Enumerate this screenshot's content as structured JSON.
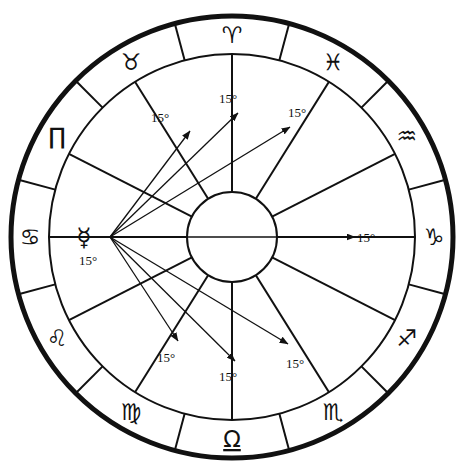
{
  "chart": {
    "type": "astrology-wheel",
    "background_color": "#ffffff",
    "line_color": "#111111",
    "geometry": {
      "center_x": 232,
      "center_y": 237,
      "outer_radius": 221,
      "sign_ring_inner_radius": 183,
      "house_ring_inner_radius": 45,
      "outer_stroke_width": 5,
      "ring_stroke_width": 2,
      "spoke_stroke_width": 2,
      "arrow_stroke_width": 1.3
    },
    "zodiac_ring": {
      "note": "Twelve 30-degree sign sectors, Aries at top, running counter-clockwise",
      "signs": [
        {
          "name": "Aries",
          "glyph": "♈",
          "center_angle_deg": 90,
          "glyph_size": 23,
          "underline": false
        },
        {
          "name": "Taurus",
          "glyph": "♉",
          "center_angle_deg": 120,
          "glyph_size": 23,
          "underline": false
        },
        {
          "name": "Gemini",
          "glyph": "∏",
          "center_angle_deg": 150,
          "glyph_size": 24,
          "underline": false
        },
        {
          "name": "Cancer",
          "glyph": "♋",
          "center_angle_deg": 180,
          "glyph_size": 23,
          "underline": false
        },
        {
          "name": "Leo",
          "glyph": "♌",
          "center_angle_deg": 210,
          "glyph_size": 23,
          "underline": false
        },
        {
          "name": "Virgo",
          "glyph": "♍",
          "center_angle_deg": 240,
          "glyph_size": 23,
          "underline": false
        },
        {
          "name": "Libra",
          "glyph": "Ω",
          "center_angle_deg": 270,
          "glyph_size": 23,
          "underline": true
        },
        {
          "name": "Scorpio",
          "glyph": "♏",
          "center_angle_deg": 300,
          "glyph_size": 23,
          "underline": false
        },
        {
          "name": "Sagittarius",
          "glyph": "♐",
          "center_angle_deg": 330,
          "glyph_size": 23,
          "underline": false
        },
        {
          "name": "Capricorn",
          "glyph": "♑",
          "center_angle_deg": 0,
          "glyph_size": 23,
          "underline": false
        },
        {
          "name": "Aquarius",
          "glyph": "♒",
          "center_angle_deg": 30,
          "glyph_size": 23,
          "underline": false
        },
        {
          "name": "Pisces",
          "glyph": "♓",
          "center_angle_deg": 60,
          "glyph_size": 23,
          "underline": false
        }
      ]
    },
    "house_cusps_deg": [
      0,
      27,
      58,
      90,
      122,
      153,
      180,
      207,
      238,
      270,
      302,
      333
    ],
    "planet": {
      "name": "Mercury",
      "glyph": "☿",
      "degree_label": "15°",
      "sign": "Cancer",
      "position_angle_deg": 180,
      "radius_from_center": 122,
      "glyph_x": 84,
      "glyph_y": 246,
      "degree_x": 88,
      "degree_y": 265
    },
    "aspect_arrows": {
      "origin_x": 110,
      "origin_y": 237,
      "label_text": "15°",
      "arrows": [
        {
          "target_sign": "Taurus",
          "tip_x": 190,
          "tip_y": 131,
          "label_x": 160,
          "label_y": 122,
          "label": "15°"
        },
        {
          "target_sign": "Aries",
          "tip_x": 238,
          "tip_y": 113,
          "label_x": 228,
          "label_y": 103,
          "label": "15°"
        },
        {
          "target_sign": "Pisces",
          "tip_x": 290,
          "tip_y": 127,
          "label_x": 297,
          "label_y": 117,
          "label": "15°"
        },
        {
          "target_sign": "Capricorn",
          "tip_x": 355,
          "tip_y": 237,
          "label_x": 366,
          "label_y": 242,
          "label": "15°"
        },
        {
          "target_sign": "Scorpio",
          "tip_x": 288,
          "tip_y": 344,
          "label_x": 295,
          "label_y": 368,
          "label": "15°"
        },
        {
          "target_sign": "Libra",
          "tip_x": 235,
          "tip_y": 361,
          "label_x": 228,
          "label_y": 381,
          "label": "15°"
        },
        {
          "target_sign": "Virgo",
          "tip_x": 178,
          "tip_y": 341,
          "label_x": 166,
          "label_y": 362,
          "label": "15°"
        }
      ]
    }
  }
}
